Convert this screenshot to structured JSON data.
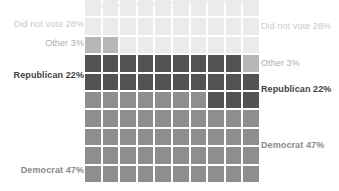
{
  "chart_data": {
    "type": "waffle",
    "title": "",
    "grid": {
      "rows": 10,
      "cols": 10,
      "fill_order": "bottom-left, row-major",
      "gridline_color": "#ffffff"
    },
    "legend_position": "labels on both left and right sides",
    "categories": [
      {
        "name": "Democrat",
        "value": 47,
        "label": "Democrat 47%",
        "cell_color": "#8e8e8e",
        "label_color": "#8a8a8a",
        "label_weight": 600
      },
      {
        "name": "Republican",
        "value": 22,
        "label": "Republican 22%",
        "cell_color": "#535353",
        "label_color": "#424242",
        "label_weight": 700
      },
      {
        "name": "Other",
        "value": 3,
        "label": "Other 3%",
        "cell_color": "#b7b7b7",
        "label_color": "#aeaeae",
        "label_weight": 400
      },
      {
        "name": "Did not vote",
        "value": 28,
        "label": "Did not vote 28%",
        "cell_color": "#ebebeb",
        "label_color": "#c9c9c9",
        "label_weight": 400
      }
    ],
    "annotation_line_color": "#dedede"
  }
}
